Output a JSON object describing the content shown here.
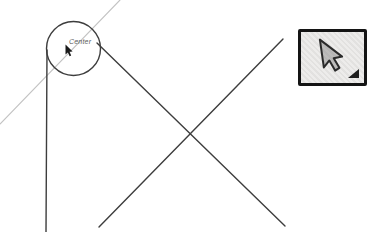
{
  "canvas": {
    "background": "#ffffff",
    "tooltip_text": "Center",
    "line_color_dark": "#3d3d3d",
    "line_color_light": "#c3c3c3",
    "cursor_color": "#1a1a1a",
    "shapes": [
      {
        "type": "line",
        "name": "inference-line-light",
        "x1": 120,
        "y1": 0,
        "x2": 0,
        "y2": 124,
        "stroke": "#c3c3c3",
        "width": 1.1
      },
      {
        "type": "circle",
        "name": "circle-edge",
        "cx": 73.5,
        "cy": 48.5,
        "r": 27,
        "stroke": "#3d3d3d",
        "width": 1.4
      },
      {
        "type": "line",
        "name": "vertical-edge",
        "x1": 47,
        "y1": 50,
        "x2": 46,
        "y2": 232,
        "stroke": "#3d3d3d",
        "width": 1.4
      },
      {
        "type": "line",
        "name": "diagonal-edge-down-right",
        "x1": 97,
        "y1": 43,
        "x2": 285,
        "y2": 226,
        "stroke": "#3d3d3d",
        "width": 1.4
      },
      {
        "type": "line",
        "name": "diagonal-edge-down-left",
        "x1": 283,
        "y1": 39,
        "x2": 99,
        "y2": 227,
        "stroke": "#3d3d3d",
        "width": 1.4
      }
    ]
  },
  "toolbar": {
    "select_button": {
      "icon": "select-cursor-icon",
      "flyout_indicator": true,
      "border_color": "#141414",
      "background": "#e7e6e4",
      "glyph_color": "#2b2b2b"
    }
  }
}
